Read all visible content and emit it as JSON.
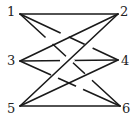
{
  "diagram": {
    "type": "knot-graph",
    "nodes": [
      {
        "id": "1",
        "label": "1",
        "x": 20,
        "y": 14
      },
      {
        "id": "2",
        "label": "2",
        "x": 118,
        "y": 14
      },
      {
        "id": "3",
        "label": "3",
        "x": 20,
        "y": 61
      },
      {
        "id": "4",
        "label": "4",
        "x": 118,
        "y": 60
      },
      {
        "id": "5",
        "label": "5",
        "x": 20,
        "y": 106
      },
      {
        "id": "6",
        "label": "6",
        "x": 120,
        "y": 106
      }
    ],
    "edges": [
      [
        "1",
        "2"
      ],
      [
        "1",
        "4"
      ],
      [
        "1",
        "6"
      ],
      [
        "2",
        "3"
      ],
      [
        "2",
        "5"
      ],
      [
        "3",
        "4"
      ],
      [
        "3",
        "6"
      ],
      [
        "4",
        "5"
      ],
      [
        "5",
        "6"
      ]
    ]
  }
}
